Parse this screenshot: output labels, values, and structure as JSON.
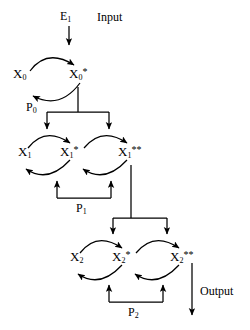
{
  "diagram": {
    "type": "cycle-cascade-diagram",
    "stroke_color": "#000000",
    "background_color": "#ffffff",
    "io_labels": {
      "input": "Input",
      "output": "Output"
    },
    "enzymes": {
      "kinase": {
        "base": "E",
        "sub": "1",
        "text": "E1"
      },
      "phosphatases": [
        {
          "base": "P",
          "sub": "0",
          "text": "P0"
        },
        {
          "base": "P",
          "sub": "1",
          "text": "P1"
        },
        {
          "base": "P",
          "sub": "2",
          "text": "P2"
        }
      ]
    },
    "levels": [
      {
        "index": 0,
        "phosphatase": {
          "base": "P",
          "sub": "0"
        },
        "species": [
          {
            "base": "X",
            "sub": "0",
            "sup": ""
          },
          {
            "base": "X",
            "sub": "0",
            "sup": "*"
          }
        ]
      },
      {
        "index": 1,
        "phosphatase": {
          "base": "P",
          "sub": "1"
        },
        "species": [
          {
            "base": "X",
            "sub": "1",
            "sup": ""
          },
          {
            "base": "X",
            "sub": "1",
            "sup": "*"
          },
          {
            "base": "X",
            "sub": "1",
            "sup": "**"
          }
        ]
      },
      {
        "index": 2,
        "phosphatase": {
          "base": "P",
          "sub": "2"
        },
        "species": [
          {
            "base": "X",
            "sub": "2",
            "sup": ""
          },
          {
            "base": "X",
            "sub": "2",
            "sup": "*"
          },
          {
            "base": "X",
            "sub": "2",
            "sup": "**"
          }
        ]
      }
    ]
  }
}
